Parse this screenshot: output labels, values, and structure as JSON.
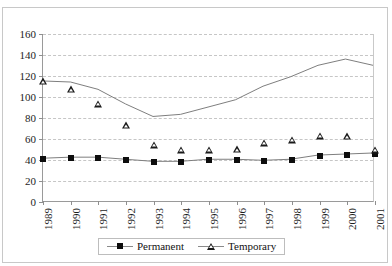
{
  "figure": {
    "top_remnant": "",
    "background": "#ffffff",
    "border_color": "#c8c8c8"
  },
  "chart_data": {
    "type": "line",
    "title": "",
    "xlabel": "",
    "ylabel": "",
    "ylim": [
      0,
      160
    ],
    "ytick_step": 20,
    "yticks": [
      0,
      20,
      40,
      60,
      80,
      100,
      120,
      140,
      160
    ],
    "grid": true,
    "grid_style": "horizontal dashed",
    "legend_position": "bottom-center",
    "categories": [
      "1989",
      "1990",
      "1991",
      "1992",
      "1993",
      "1994",
      "1995",
      "1996",
      "1997",
      "1998",
      "1999",
      "2000",
      "2001"
    ],
    "series": [
      {
        "name": "Permanent",
        "marker": "filled-square",
        "color": "#0d0d0d",
        "values": [
          41,
          42,
          42,
          40,
          38,
          38,
          40,
          40,
          39,
          40,
          44,
          45,
          46
        ]
      },
      {
        "name": "Temporary",
        "marker": "open-triangle",
        "color": "#1a1a1a",
        "values": [
          115,
          114,
          107,
          93,
          81,
          83,
          90,
          97,
          110,
          119,
          130,
          136,
          130
        ]
      }
    ]
  },
  "legend": {
    "items": [
      {
        "label": "Permanent",
        "marker": "square-marker"
      },
      {
        "label": "Temporary",
        "marker": "triangle-marker"
      }
    ]
  }
}
